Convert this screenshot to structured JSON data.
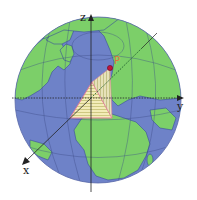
{
  "diagram": {
    "type": "globe-coordinate-axes",
    "colors": {
      "ocean": "#6f82c9",
      "land": "#7ccf6a",
      "coast": "#3b4f9a",
      "grid": "#3c4c86",
      "axis": "#222222",
      "point": "#c0143c",
      "point_label": "#e0733a",
      "triangle_outline": "#e27a9a",
      "triangle_fill": "#f2e6a8",
      "triangle_hatch": "#c9c47a"
    },
    "axes": {
      "z": {
        "label": "z"
      },
      "y": {
        "label": "y"
      },
      "x": {
        "label": "x"
      }
    },
    "point": {
      "label": "P"
    }
  }
}
